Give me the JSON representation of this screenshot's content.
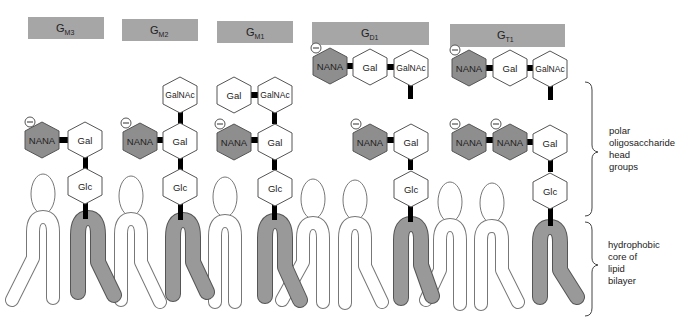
{
  "titles": [
    {
      "main": "G",
      "sub": "M3"
    },
    {
      "main": "G",
      "sub": "M2"
    },
    {
      "main": "G",
      "sub": "M1"
    },
    {
      "main": "G",
      "sub": "D1"
    },
    {
      "main": "G",
      "sub": "T1"
    }
  ],
  "sugars": {
    "nana": "NANA",
    "gal": "Gal",
    "glc": "Glc",
    "galnac": "GalNAc"
  },
  "labels": {
    "polar": [
      "polar",
      "oligosaccharide",
      "head",
      "groups"
    ],
    "hydrophobic": [
      "hydrophobic",
      "core of",
      "lipid",
      "bilayer"
    ]
  },
  "colors": {
    "title_box": "#a6a6a6",
    "nana_fill": "#8e8e8e",
    "ganglioside_tail": "#999999",
    "bond": "#000000"
  }
}
